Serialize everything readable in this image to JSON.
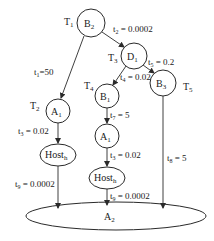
{
  "diagram": {
    "nodes": {
      "B2": {
        "label": "B",
        "sub": "2",
        "task": "T",
        "task_sub": "1"
      },
      "D1": {
        "label": "D",
        "sub": "1",
        "task": "T",
        "task_sub": "3"
      },
      "B1": {
        "label": "B",
        "sub": "1",
        "task": "T",
        "task_sub": "4"
      },
      "B3": {
        "label": "B",
        "sub": "3",
        "task": "T",
        "task_sub": "5"
      },
      "A1_left": {
        "label": "A",
        "sub": "1",
        "task": "T",
        "task_sub": "2"
      },
      "A1_mid": {
        "label": "A",
        "sub": "1"
      },
      "Host_left": {
        "label": "Host",
        "sub": "h"
      },
      "Host_mid": {
        "label": "Host",
        "sub": "h"
      },
      "A2": {
        "label": "A",
        "sub": "2"
      }
    },
    "edges": {
      "e1": {
        "t": "t",
        "sub": "1",
        "value": "=50"
      },
      "e2": {
        "t": "t",
        "sub": "2",
        "value": " = 0.0002"
      },
      "e3_left": {
        "t": "t",
        "sub": "3",
        "value": " = 0.02"
      },
      "e3_mid": {
        "t": "t",
        "sub": "3",
        "value": " = 0.02"
      },
      "e4": {
        "t": "t",
        "sub": "4",
        "value": " = 0.02"
      },
      "e5": {
        "t": "t",
        "sub": "5",
        "value": " = 0.2"
      },
      "e7": {
        "t": "t",
        "sub": "7",
        "value": " = 5"
      },
      "e8": {
        "t": "t",
        "sub": "8",
        "value": " = 5"
      },
      "e9_left": {
        "t": "t",
        "sub": "9",
        "value": " = 0.0002"
      },
      "e9_mid": {
        "t": "t",
        "sub": "9",
        "value": " = 0.0002"
      }
    },
    "colors": {
      "stroke": "#2a2a2a",
      "text": "#222222",
      "background": "#ffffff"
    }
  }
}
